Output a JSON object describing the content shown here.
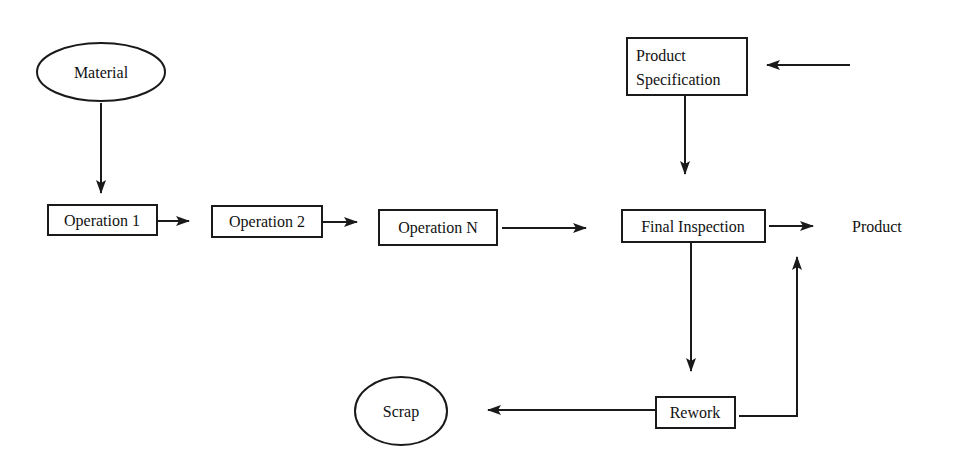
{
  "diagram": {
    "type": "flowchart",
    "colors": {
      "stroke": "#1a1a1a",
      "text": "#111111",
      "background": "#ffffff"
    },
    "nodes": {
      "material": {
        "label": "Material",
        "shape": "ellipse"
      },
      "operation_1": {
        "label": "Operation 1",
        "shape": "box"
      },
      "operation_2": {
        "label": "Operation 2",
        "shape": "box"
      },
      "operation_n": {
        "label": "Operation N",
        "shape": "box"
      },
      "final_inspection": {
        "label": "Final Inspection",
        "shape": "box"
      },
      "product": {
        "label": "Product",
        "shape": "text"
      },
      "product_specification": {
        "label_line1": "Product",
        "label_line2": "Specification",
        "shape": "box"
      },
      "rework": {
        "label": "Rework",
        "shape": "box"
      },
      "scrap": {
        "label": "Scrap",
        "shape": "ellipse"
      }
    },
    "edges": [
      {
        "from": "material",
        "to": "operation_1"
      },
      {
        "from": "operation_1",
        "to": "operation_2"
      },
      {
        "from": "operation_2",
        "to": "operation_n"
      },
      {
        "from": "operation_n",
        "to": "final_inspection"
      },
      {
        "from": "final_inspection",
        "to": "product"
      },
      {
        "from": "external",
        "to": "product_specification"
      },
      {
        "from": "product_specification",
        "to": "final_inspection"
      },
      {
        "from": "final_inspection",
        "to": "rework"
      },
      {
        "from": "rework",
        "to": "scrap"
      },
      {
        "from": "rework",
        "to": "product"
      }
    ]
  }
}
